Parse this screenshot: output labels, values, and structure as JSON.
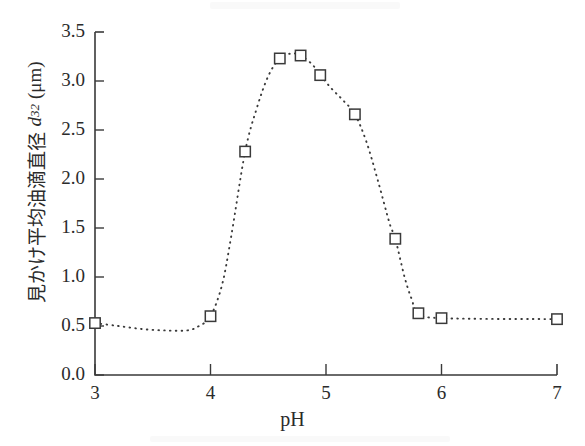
{
  "figure": {
    "background_color": "#ffffff",
    "ink_color": "#3a3a3a"
  },
  "chart_data": {
    "type": "line",
    "title": "",
    "subtitle": "",
    "xlabel": "pH",
    "ylabel": "見かけ平均油滴直径 d32 (μm)",
    "ylabel_parts": {
      "text": "見かけ平均油滴直径",
      "symbol": "d",
      "subscript": "32",
      "unit": "(μm)"
    },
    "xlim": [
      3,
      7
    ],
    "ylim": [
      0.0,
      3.5
    ],
    "xticks": [
      3,
      4,
      5,
      6,
      7
    ],
    "xtick_labels": [
      "3",
      "4",
      "5",
      "6",
      "7"
    ],
    "yticks": [
      0.0,
      0.5,
      1.0,
      1.5,
      2.0,
      2.5,
      3.0,
      3.5
    ],
    "ytick_labels": [
      "0.0",
      "0.5",
      "1.0",
      "1.5",
      "2.0",
      "2.5",
      "3.0",
      "3.5"
    ],
    "grid": false,
    "legend": null,
    "marker": "open-square",
    "linestyle": "dotted",
    "series": [
      {
        "name": "apparent mean oil droplet diameter",
        "x": [
          3.0,
          4.0,
          4.3,
          4.6,
          4.78,
          4.95,
          5.25,
          5.6,
          5.8,
          6.0,
          7.0
        ],
        "values": [
          0.53,
          0.6,
          2.28,
          3.23,
          3.26,
          3.06,
          2.66,
          1.39,
          0.63,
          0.58,
          0.57
        ]
      }
    ],
    "curve_points": [
      [
        3.0,
        0.53
      ],
      [
        3.2,
        0.5
      ],
      [
        3.4,
        0.47
      ],
      [
        3.6,
        0.455
      ],
      [
        3.8,
        0.455
      ],
      [
        3.9,
        0.5
      ],
      [
        4.0,
        0.6
      ],
      [
        4.1,
        0.92
      ],
      [
        4.18,
        1.42
      ],
      [
        4.3,
        2.28
      ],
      [
        4.4,
        2.72
      ],
      [
        4.5,
        3.05
      ],
      [
        4.6,
        3.23
      ],
      [
        4.7,
        3.28
      ],
      [
        4.78,
        3.26
      ],
      [
        4.88,
        3.17
      ],
      [
        4.95,
        3.06
      ],
      [
        5.05,
        2.92
      ],
      [
        5.15,
        2.8
      ],
      [
        5.25,
        2.66
      ],
      [
        5.35,
        2.38
      ],
      [
        5.45,
        1.98
      ],
      [
        5.55,
        1.55
      ],
      [
        5.6,
        1.39
      ],
      [
        5.68,
        1.0
      ],
      [
        5.74,
        0.78
      ],
      [
        5.8,
        0.63
      ],
      [
        6.0,
        0.58
      ],
      [
        7.0,
        0.57
      ]
    ]
  }
}
